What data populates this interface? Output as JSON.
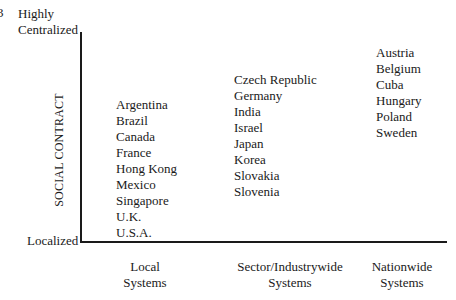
{
  "figure": {
    "figure_number_fragment": "3"
  },
  "y_axis": {
    "title": "SOCIAL CONTRACT",
    "top_label_line1": "Highly",
    "top_label_line2": "Centralized",
    "bottom_label": "Localized"
  },
  "x_axis": {
    "categories": [
      {
        "line1": "Local",
        "line2": "Systems"
      },
      {
        "line1": "Sector/Industrywide",
        "line2": "Systems"
      },
      {
        "line1": "Nationwide",
        "line2": "Systems"
      }
    ]
  },
  "groups": [
    {
      "category": "Local Systems",
      "countries": [
        "Argentina",
        "Brazil",
        "Canada",
        "France",
        "Hong Kong",
        "Mexico",
        "Singapore",
        "U.K.",
        "U.S.A."
      ]
    },
    {
      "category": "Sector/Industrywide Systems",
      "countries": [
        "Czech Republic",
        "Germany",
        "India",
        "Israel",
        "Japan",
        "Korea",
        "Slovakia",
        "Slovenia"
      ]
    },
    {
      "category": "Nationwide Systems",
      "countries": [
        "Austria",
        "Belgium",
        "Cuba",
        "Hungary",
        "Poland",
        "Sweden"
      ]
    }
  ]
}
